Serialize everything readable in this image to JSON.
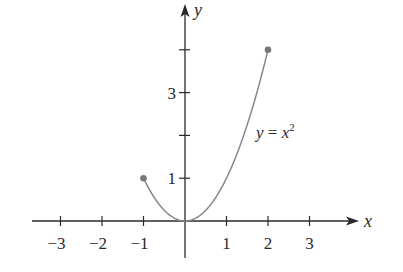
{
  "chart_data": {
    "type": "line",
    "title": "",
    "xlabel": "x",
    "ylabel": "y",
    "xlim": [
      -3.5,
      4
    ],
    "ylim": [
      -1.3,
      5
    ],
    "grid": false,
    "legend": null,
    "x_ticks": [
      -3,
      -2,
      -1,
      1,
      2,
      3
    ],
    "x_tick_labels": [
      "−3",
      "−2",
      "−1",
      "1",
      "2",
      "3"
    ],
    "y_ticks": [
      1,
      2,
      3,
      4
    ],
    "y_tick_labels": [
      "1",
      "",
      "3",
      ""
    ],
    "series": [
      {
        "name": "y = x^2",
        "function": "x^2",
        "domain": [
          -1,
          2
        ],
        "x": [
          -1,
          -0.5,
          0,
          0.5,
          1,
          1.5,
          2
        ],
        "y": [
          1,
          0.25,
          0,
          0.25,
          1,
          2.25,
          4
        ],
        "color": "#888888"
      }
    ],
    "endpoints": [
      {
        "x": -1,
        "y": 1,
        "style": "closed-dot"
      },
      {
        "x": 2,
        "y": 4,
        "style": "closed-dot"
      }
    ],
    "annotations": [
      {
        "text_main": "y = x",
        "superscript": "2",
        "at": {
          "x": 1.75,
          "y": 2.0
        }
      }
    ]
  },
  "labels": {
    "x_axis": "x",
    "y_axis": "y",
    "curve_main_y": "y",
    "curve_eq": " = ",
    "curve_x": "x",
    "curve_sup": "2"
  },
  "colors": {
    "axis": "#2a2a2a",
    "curve": "#888888",
    "dot": "#777777"
  }
}
